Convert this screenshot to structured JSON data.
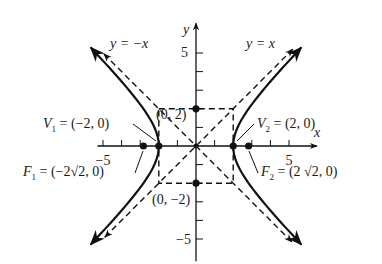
{
  "chart_data": {
    "type": "diagram",
    "title": "",
    "equation": "x^2/4 - y^2/4 = 1",
    "xlabel": "x",
    "ylabel": "y",
    "xlim": [
      -5.3,
      6.5
    ],
    "ylim": [
      -6.2,
      6.6
    ],
    "tick_step": 1,
    "xtick_labels": [
      {
        "value": -5,
        "text": "−5"
      },
      {
        "value": 5,
        "text": "5"
      }
    ],
    "ytick_labels": [
      {
        "value": 5,
        "text": "5"
      },
      {
        "value": -5,
        "text": "−5"
      }
    ],
    "hyperbola": {
      "a": 2,
      "b": 2,
      "t_max": 1.7
    },
    "asymptotes": [
      {
        "name": "y = x",
        "slope": 1,
        "x_range": [
          -4.9,
          5.2
        ],
        "label": "y = x"
      },
      {
        "name": "y = -x",
        "slope": -1,
        "x_range": [
          -4.95,
          5.15
        ],
        "label": "y = −x"
      }
    ],
    "rectangle": {
      "x": [
        -2,
        2
      ],
      "y": [
        -2,
        2
      ]
    },
    "points": [
      {
        "id": "V1",
        "x": -2,
        "y": 0,
        "label_main": "V",
        "label_sub": "1",
        "label_rest": " = (−2, 0)"
      },
      {
        "id": "V2",
        "x": 2,
        "y": 0,
        "label_main": "V",
        "label_sub": "2",
        "label_rest": " = (2, 0)"
      },
      {
        "id": "F1",
        "x": -2.828,
        "y": 0,
        "label_main": "F",
        "label_sub": "1",
        "label_rest": " = (−2√2, 0)"
      },
      {
        "id": "F2",
        "x": 2.828,
        "y": 0,
        "label_main": "F",
        "label_sub": "2",
        "label_rest": " = (2 √2, 0)"
      },
      {
        "id": "B1",
        "x": 0,
        "y": 2,
        "label_rest": "(0, 2)"
      },
      {
        "id": "B2",
        "x": 0,
        "y": -2,
        "label_rest": "(0, −2)"
      },
      {
        "id": "O",
        "x": 0,
        "y": 0
      }
    ]
  }
}
